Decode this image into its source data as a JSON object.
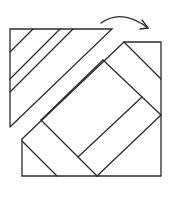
{
  "diagram": {
    "stroke_color": "#2b2b2b",
    "background_color": "#ffffff",
    "arrow": {
      "direction": "right",
      "meaning": "fold-over"
    },
    "triangle": {
      "vertices": [
        [
          10,
          29
        ],
        [
          112,
          29
        ],
        [
          10,
          127
        ]
      ],
      "stripes": [
        [
          [
            33,
            29
          ],
          [
            10,
            52
          ]
        ],
        [
          [
            60,
            29
          ],
          [
            10,
            75
          ]
        ],
        [
          [
            73,
            29
          ],
          [
            10,
            89
          ]
        ]
      ]
    },
    "square": {
      "outline": [
        [
          124,
          42
        ],
        [
          161,
          42
        ],
        [
          161,
          176
        ],
        [
          22,
          176
        ],
        [
          22,
          139
        ]
      ],
      "tilted_edges": [
        [
          [
            124,
            42
          ],
          [
            22,
            139
          ]
        ],
        [
          [
            124,
            42
          ],
          [
            161,
            79
          ]
        ],
        [
          [
            22,
            139
          ],
          [
            57,
            176
          ]
        ],
        [
          [
            41,
            120
          ],
          [
            97,
            176
          ]
        ],
        [
          [
            97,
            176
          ],
          [
            161,
            115
          ]
        ],
        [
          [
            103,
            60
          ],
          [
            41,
            120
          ]
        ],
        [
          [
            103,
            60
          ],
          [
            161,
            115
          ]
        ],
        [
          [
            78,
            157
          ],
          [
            142,
            97
          ]
        ]
      ]
    }
  }
}
